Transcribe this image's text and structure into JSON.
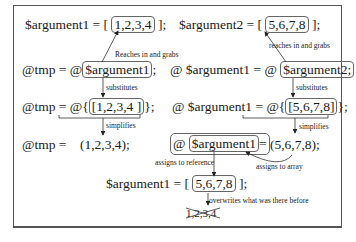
{
  "diagram": {
    "left_column": {
      "line1": {
        "prefix": "$argument1 =   [",
        "boxed": "1,2,3,4",
        "suffix": "];"
      },
      "line2": {
        "prefix": "@tmp  =  @",
        "boxed": "$argument1",
        "suffix": ";"
      },
      "line3": {
        "prefix": "@tmp  =  @{",
        "boxed": "[1,2,3,4 ]",
        "suffix": "};"
      },
      "line4": {
        "prefix": "@tmp  =",
        "value": "(1,2,3,4);"
      }
    },
    "right_column": {
      "line1": {
        "prefix": "$argument2 =   [",
        "boxed": "5,6,7,8",
        "suffix": "];"
      },
      "line2": {
        "prefix": "@ $argument1 = @",
        "boxed": "$argument2;"
      },
      "line3": {
        "prefix": "@ $argument1 = @{",
        "boxed": "[5,6,7,8]",
        "suffix": "};"
      },
      "line4": {
        "prefix": "@",
        "boxed": "$argument1",
        "suffix": "=",
        "value": "(5,6,7,8);"
      }
    },
    "bottom": {
      "line": {
        "prefix": "$argument1 =   [",
        "boxed": "5,6,7,8",
        "suffix": "];"
      },
      "old_value": "1,2,3,4"
    },
    "annotations": {
      "reaches_left": "Reaches in and grabs",
      "reaches_right": "reaches in and grabs",
      "substitutes_left": "substitutes",
      "substitutes_right": "substitutes",
      "simplifies_left": "simplifies",
      "simplifies_right": "simplifies",
      "assigns_reference": "assigns to reference",
      "assigns_array": "assigns to array",
      "overwrites": "overwrites what was there before"
    }
  }
}
